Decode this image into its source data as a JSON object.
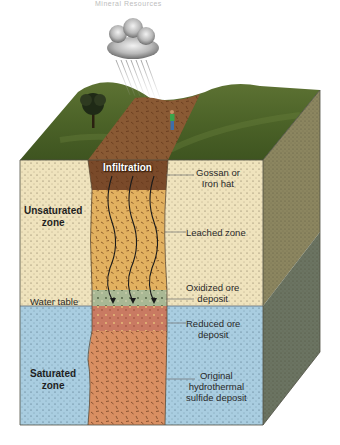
{
  "figure": {
    "header_text": "Mineral Resources",
    "labels": {
      "infiltration": "Infiltration",
      "gossan_line1": "Gossan or",
      "gossan_line2": "Iron hat",
      "leached_zone": "Leached zone",
      "oxidized_line1": "Oxidized ore",
      "oxidized_line2": "deposit",
      "water_table": "Water table",
      "reduced_line1": "Reduced ore",
      "reduced_line2": "deposit",
      "original_line1": "Original",
      "original_line2": "hydrothermal",
      "original_line3": "sulfide deposit",
      "unsaturated_line1": "Unsaturated",
      "unsaturated_line2": "zone",
      "saturated_line1": "Saturated",
      "saturated_line2": "zone"
    },
    "layers": [
      {
        "name": "Gossan or Iron hat",
        "color": "#7a4a2a"
      },
      {
        "name": "Leached zone",
        "color": "#e2b160"
      },
      {
        "name": "Oxidized ore deposit",
        "color": "#a9b894"
      },
      {
        "name": "Reduced ore deposit",
        "color": "#c97a62"
      },
      {
        "name": "Original hydrothermal sulfide deposit",
        "color": "#d98f62"
      }
    ],
    "zones": [
      {
        "name": "Unsaturated zone",
        "color": "#efe3bd"
      },
      {
        "name": "Saturated zone",
        "color": "#a9cde0"
      }
    ],
    "icons": [
      "cloud-icon",
      "rain-icon",
      "tree-icon",
      "person-icon",
      "infiltration-arrow-icon"
    ]
  }
}
